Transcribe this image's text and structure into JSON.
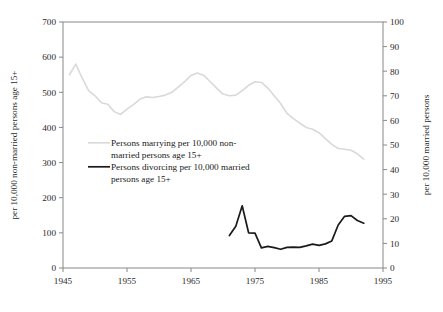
{
  "chart_data": {
    "type": "line",
    "title": "",
    "xlabel": "",
    "ylabel": "per 10,000 non-married persons age 15+",
    "y2label": "per 10,000 married persons",
    "xlim": [
      1945,
      1995
    ],
    "ylim": [
      0,
      700
    ],
    "y2lim": [
      0,
      100
    ],
    "grid": false,
    "legend_position": "inside-upper-left",
    "x_ticks": [
      "1945",
      "1955",
      "1965",
      "1975",
      "1985",
      "1995"
    ],
    "x_tick_values": [
      1945,
      1955,
      1965,
      1975,
      1985,
      1995
    ],
    "y_ticks": [
      "0",
      "100",
      "200",
      "300",
      "400",
      "500",
      "600",
      "700"
    ],
    "y_tick_values": [
      0,
      100,
      200,
      300,
      400,
      500,
      600,
      700
    ],
    "y2_ticks": [
      "0",
      "10",
      "20",
      "30",
      "40",
      "50",
      "60",
      "70",
      "80",
      "90",
      "100"
    ],
    "y2_tick_values": [
      0,
      10,
      20,
      30,
      40,
      50,
      60,
      70,
      80,
      90,
      100
    ],
    "series": [
      {
        "name": "Persons marrying per 10,000 non-married persons age 15+",
        "axis": "left",
        "color": "#d9d9d9",
        "width": 1.6,
        "x": [
          1946,
          1947,
          1948,
          1949,
          1950,
          1951,
          1952,
          1953,
          1954,
          1955,
          1956,
          1957,
          1958,
          1959,
          1960,
          1961,
          1962,
          1963,
          1964,
          1965,
          1966,
          1967,
          1968,
          1969,
          1970,
          1971,
          1972,
          1973,
          1974,
          1975,
          1976,
          1977,
          1978,
          1979,
          1980,
          1981,
          1982,
          1983,
          1984,
          1985,
          1986,
          1987,
          1988,
          1989,
          1990,
          1991,
          1992
        ],
        "values": [
          550,
          580,
          540,
          505,
          490,
          470,
          466,
          445,
          437,
          452,
          465,
          480,
          487,
          485,
          488,
          492,
          500,
          515,
          530,
          548,
          555,
          548,
          530,
          512,
          495,
          490,
          492,
          505,
          520,
          530,
          528,
          512,
          490,
          468,
          440,
          425,
          412,
          400,
          395,
          385,
          368,
          352,
          340,
          338,
          335,
          325,
          310
        ]
      },
      {
        "name": "Persons divorcing per 10,000 married persons age 15+",
        "axis": "right",
        "color": "#1a1a1a",
        "width": 1.7,
        "x": [
          1971,
          1972,
          1973,
          1974,
          1975,
          1976,
          1977,
          1978,
          1979,
          1980,
          1981,
          1982,
          1983,
          1984,
          1985,
          1986,
          1987,
          1988,
          1989,
          1990,
          1991,
          1992
        ],
        "values": [
          13.2,
          17.0,
          25.3,
          14.3,
          14.2,
          8.2,
          8.8,
          8.3,
          7.6,
          8.4,
          8.5,
          8.4,
          9.0,
          9.7,
          9.2,
          9.8,
          11.0,
          17.5,
          21.0,
          21.3,
          19.3,
          18.2
        ]
      }
    ],
    "legend": [
      {
        "label_lines": [
          "Persons marrying per 10,000 non-",
          "married persons age 15+"
        ],
        "color": "#d9d9d9"
      },
      {
        "label_lines": [
          "Persons divorcing per 10,000 married",
          "persons age 15+"
        ],
        "color": "#1a1a1a"
      }
    ]
  }
}
